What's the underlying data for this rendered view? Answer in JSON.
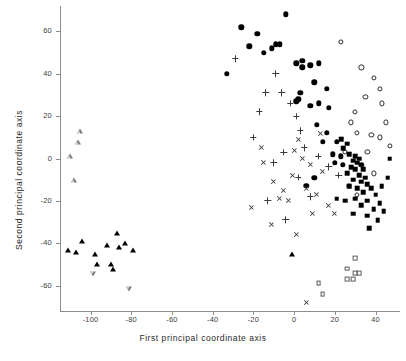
{
  "chart_data": {
    "type": "scatter",
    "title": "",
    "xlabel": "First principal coordinate axis",
    "ylabel": "Second principal coordinate axis",
    "xlim": [
      -115,
      52
    ],
    "ylim": [
      -72,
      72
    ],
    "xticks": [
      -100,
      -80,
      -60,
      -40,
      -20,
      0,
      20,
      40
    ],
    "xticklabels": [
      "-100",
      "-80",
      "-60",
      "-40",
      "-20",
      "0",
      "20",
      "40"
    ],
    "yticks": [
      -60,
      -40,
      -20,
      0,
      20,
      40,
      60
    ],
    "yticklabels": [
      "-60",
      "-40",
      "-20",
      "0",
      "20",
      "40",
      "60"
    ],
    "grid": false,
    "legend": "none",
    "series": [
      {
        "name": "filled-circle",
        "marker": "filled-circle",
        "points": [
          [
            -26,
            62
          ],
          [
            -22,
            53
          ],
          [
            -18,
            59
          ],
          [
            -15,
            50
          ],
          [
            -11,
            52
          ],
          [
            -9,
            54
          ],
          [
            -7,
            54
          ],
          [
            -4,
            68
          ],
          [
            -33,
            40
          ],
          [
            1,
            45
          ],
          [
            4,
            46
          ],
          [
            4,
            43
          ],
          [
            8,
            44
          ],
          [
            10,
            36
          ],
          [
            12,
            45
          ],
          [
            3,
            31
          ],
          [
            2,
            28
          ],
          [
            1,
            27
          ],
          [
            8,
            25
          ],
          [
            12,
            26
          ],
          [
            16,
            33
          ],
          [
            17,
            24
          ],
          [
            11,
            16
          ],
          [
            16,
            12
          ],
          [
            14,
            8
          ],
          [
            21,
            8
          ],
          [
            19,
            2
          ],
          [
            23,
            1
          ],
          [
            10,
            -9
          ],
          [
            6,
            -13
          ],
          [
            20,
            -2
          ],
          [
            24,
            -3
          ]
        ]
      },
      {
        "name": "open-circle",
        "marker": "open-circle",
        "points": [
          [
            23,
            55
          ],
          [
            33,
            43
          ],
          [
            39,
            38
          ],
          [
            42,
            33
          ],
          [
            43,
            26
          ],
          [
            45,
            17
          ],
          [
            47,
            6
          ],
          [
            35,
            29
          ],
          [
            30,
            22
          ],
          [
            28,
            17
          ],
          [
            31,
            12
          ],
          [
            38,
            11
          ],
          [
            42,
            10
          ],
          [
            36,
            3
          ],
          [
            33,
            -3
          ],
          [
            39,
            -7
          ],
          [
            27,
            -13
          ],
          [
            31,
            -17
          ],
          [
            25,
            3
          ]
        ]
      },
      {
        "name": "filled-square",
        "marker": "filled-square",
        "points": [
          [
            27,
            2
          ],
          [
            30,
            1
          ],
          [
            32,
            0
          ],
          [
            29,
            -1
          ],
          [
            31,
            -2
          ],
          [
            33,
            -3
          ],
          [
            28,
            -4
          ],
          [
            30,
            -5
          ],
          [
            34,
            -5
          ],
          [
            26,
            -7
          ],
          [
            32,
            -8
          ],
          [
            35,
            -9
          ],
          [
            29,
            -10
          ],
          [
            33,
            -11
          ],
          [
            36,
            -12
          ],
          [
            27,
            -13
          ],
          [
            31,
            -14
          ],
          [
            38,
            -14
          ],
          [
            34,
            -16
          ],
          [
            40,
            -17
          ],
          [
            30,
            -19
          ],
          [
            36,
            -20
          ],
          [
            42,
            -21
          ],
          [
            33,
            -22
          ],
          [
            39,
            -24
          ],
          [
            44,
            -25
          ],
          [
            36,
            -27
          ],
          [
            41,
            -29
          ],
          [
            46,
            -9
          ],
          [
            43,
            -13
          ],
          [
            24,
            5
          ],
          [
            26,
            7
          ],
          [
            23,
            9
          ],
          [
            21,
            -19
          ],
          [
            25,
            -20
          ],
          [
            29,
            -26
          ],
          [
            37,
            -33
          ],
          [
            47,
            0
          ]
        ]
      },
      {
        "name": "open-square",
        "marker": "open-square",
        "points": [
          [
            30,
            -47
          ],
          [
            26,
            -52
          ],
          [
            30,
            -54
          ],
          [
            32,
            -54
          ],
          [
            26,
            -57
          ],
          [
            29,
            -57
          ],
          [
            14,
            -64
          ],
          [
            12,
            -59
          ]
        ]
      },
      {
        "name": "filled-triangle",
        "marker": "filled-triangle",
        "points": [
          [
            -107,
            -44
          ],
          [
            -104,
            -39
          ],
          [
            -98,
            -45
          ],
          [
            -97,
            -50
          ],
          [
            -92,
            -41
          ],
          [
            -87,
            -35
          ],
          [
            -86,
            -42
          ],
          [
            -83,
            -40
          ],
          [
            -90,
            -50
          ],
          [
            -89,
            -52
          ],
          [
            -79,
            -43
          ],
          [
            -111,
            -43
          ],
          [
            -1,
            -45
          ]
        ]
      },
      {
        "name": "open-triangle",
        "marker": "open-triangle",
        "points": [
          [
            -105,
            13
          ],
          [
            -106,
            10
          ],
          [
            -110,
            6
          ],
          [
            -108,
            -3
          ]
        ]
      },
      {
        "name": "open-down-triangle",
        "marker": "open-down-triangle",
        "points": [
          [
            -99,
            -45
          ],
          [
            -81,
            -50
          ]
        ]
      },
      {
        "name": "plus",
        "marker": "plus",
        "points": [
          [
            -29,
            47
          ],
          [
            -14,
            31
          ],
          [
            -17,
            22
          ],
          [
            -20,
            10
          ],
          [
            -6,
            31
          ],
          [
            -2,
            26
          ],
          [
            1,
            20
          ],
          [
            3,
            13
          ],
          [
            -5,
            3
          ],
          [
            -10,
            -2
          ],
          [
            2,
            -9
          ],
          [
            8,
            -18
          ],
          [
            17,
            -4
          ],
          [
            22,
            -8
          ],
          [
            12,
            1
          ],
          [
            -13,
            -20
          ],
          [
            -9,
            40
          ],
          [
            -4,
            -29
          ],
          [
            5,
            5
          ]
        ]
      },
      {
        "name": "cross",
        "marker": "cross",
        "points": [
          [
            -16,
            5
          ],
          [
            -15,
            -2
          ],
          [
            -10,
            -11
          ],
          [
            -7,
            -19
          ],
          [
            -3,
            -20
          ],
          [
            -1,
            -8
          ],
          [
            0,
            4
          ],
          [
            2,
            9
          ],
          [
            4,
            0
          ],
          [
            6,
            -14
          ],
          [
            9,
            -26
          ],
          [
            11,
            -17
          ],
          [
            14,
            -6
          ],
          [
            -5,
            -15
          ],
          [
            -21,
            -23
          ],
          [
            -11,
            -31
          ],
          [
            1,
            -36
          ],
          [
            6,
            -68
          ],
          [
            17,
            -22
          ],
          [
            20,
            -26
          ],
          [
            13,
            12
          ],
          [
            8,
            -3
          ]
        ]
      }
    ]
  }
}
